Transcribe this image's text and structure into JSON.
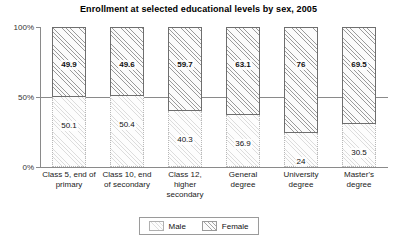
{
  "chart_data": {
    "type": "bar",
    "title": "Enrollment at selected educational levels by sex, 2005",
    "xlabel": "",
    "ylabel": "",
    "ylim": [
      0,
      100
    ],
    "stacked": true,
    "stack_total": 100,
    "grid": false,
    "reference_line": 50,
    "legend_position": "bottom",
    "categories": [
      "Class 5, end of primary",
      "Class 10, end of secondary",
      "Class 12, higher secondary",
      "General degree",
      "University degree",
      "Master's degree"
    ],
    "category_lines": [
      [
        "Class 5, end of",
        "primary"
      ],
      [
        "Class 10, end",
        "of secondary"
      ],
      [
        "Class 12,",
        "higher",
        "secondary"
      ],
      [
        "General",
        "degree"
      ],
      [
        "University",
        "degree"
      ],
      [
        "Master's",
        "degree"
      ]
    ],
    "series": [
      {
        "name": "Female",
        "values": [
          49.9,
          49.6,
          59.7,
          63.1,
          76,
          69.5
        ],
        "labels": [
          "49.9",
          "49.6",
          "59.7",
          "63.1",
          "76",
          "69.5"
        ]
      },
      {
        "name": "Male",
        "values": [
          50.1,
          50.4,
          40.3,
          36.9,
          24,
          30.5
        ],
        "labels": [
          "50.1",
          "50.4",
          "40.3",
          "36.9",
          "24",
          "30.5"
        ]
      }
    ],
    "yticks": [
      {
        "value": 100,
        "label": "100%"
      },
      {
        "value": 50,
        "label": "50%"
      },
      {
        "value": 0,
        "label": "0%"
      }
    ]
  },
  "legend": {
    "entries": [
      {
        "label": "Male",
        "swatch": "hatch-light-swatch"
      },
      {
        "label": "Female",
        "swatch": "hatch-dense-swatch"
      }
    ]
  },
  "colors": {
    "axis": "#8a8a8a",
    "female_hatch": "#9a9a9a",
    "male_hatch": "#dcdcdc",
    "text": "#111111",
    "background": "#ffffff"
  }
}
